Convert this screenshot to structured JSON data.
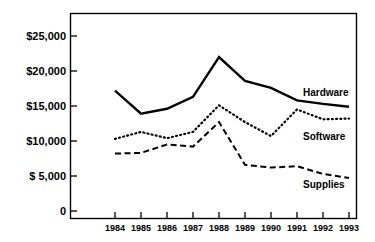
{
  "chart_data": {
    "type": "line",
    "title": "",
    "subtitle": "",
    "xlabel": "",
    "ylabel": "",
    "categories": [
      "1984",
      "1985",
      "1986",
      "1987",
      "1988",
      "1989",
      "1990",
      "1991",
      "1992",
      "1993"
    ],
    "x": [
      1984,
      1985,
      1986,
      1987,
      1988,
      1989,
      1990,
      1991,
      1992,
      1993
    ],
    "xlim": [
      1983.4,
      1993.6
    ],
    "ylim": [
      0,
      26500
    ],
    "grid": false,
    "legend_position": "inline-right-end-labels",
    "y_ticks": [
      0,
      5000,
      10000,
      15000,
      20000,
      25000
    ],
    "y_tick_labels": [
      "0",
      "$ 5,000",
      "$10,000",
      "$15,000",
      "$20,000",
      "$25,000"
    ],
    "series": [
      {
        "name": "Hardware",
        "style": "solid",
        "color": "#000000",
        "values": [
          17200,
          13900,
          14600,
          16300,
          22000,
          18600,
          17600,
          15800,
          15300,
          14900
        ]
      },
      {
        "name": "Software",
        "style": "dotted",
        "color": "#000000",
        "values": [
          10300,
          11300,
          10400,
          11300,
          15100,
          12700,
          10700,
          14500,
          13100,
          13200
        ]
      },
      {
        "name": "Supplies",
        "style": "dashed",
        "color": "#000000",
        "values": [
          8200,
          8300,
          9500,
          9200,
          12700,
          6600,
          6200,
          6400,
          5300,
          4700
        ]
      }
    ],
    "annotations": [
      {
        "text": "Hardware",
        "series": "Hardware",
        "x": 1993,
        "y": 17200
      },
      {
        "text": "Software",
        "series": "Software",
        "x": 1993,
        "y": 11000
      },
      {
        "text": "Supplies",
        "series": "Supplies",
        "x": 1993,
        "y": 4000
      }
    ]
  }
}
